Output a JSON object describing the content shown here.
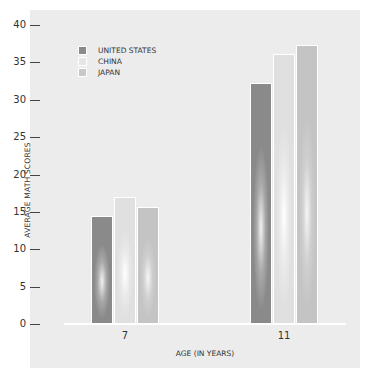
{
  "chart_data": {
    "type": "bar",
    "title": "",
    "xlabel": "AGE (IN YEARS)",
    "ylabel": "AVERAGE MATH SCORES",
    "categories": [
      "7",
      "11"
    ],
    "series": [
      {
        "name": "UNITED STATES",
        "values": [
          14.5,
          32.2
        ],
        "color": "#8a8a8a"
      },
      {
        "name": "CHINA",
        "values": [
          17.0,
          36.1
        ],
        "color": "#e6e6e6"
      },
      {
        "name": "JAPAN",
        "values": [
          15.7,
          37.3
        ],
        "color": "#c8c8c8"
      }
    ],
    "ylim": [
      0,
      40
    ],
    "yticks": [
      "0",
      "5",
      "10",
      "15",
      "20",
      "25",
      "30",
      "35",
      "40"
    ],
    "grid": false,
    "legend_position": "upper-left"
  },
  "legend": {
    "items": [
      {
        "label": "UNITED STATES"
      },
      {
        "label": "CHINA"
      },
      {
        "label": "JAPAN"
      }
    ]
  }
}
